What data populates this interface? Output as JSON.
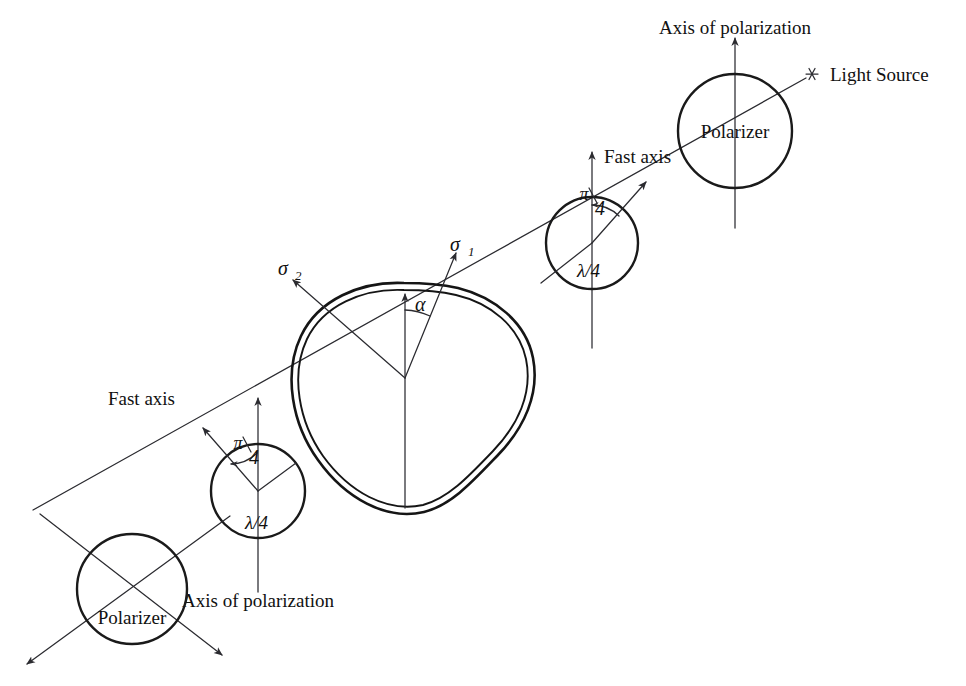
{
  "figure": {
    "background_color": "#ffffff",
    "line_color": "#1a1a1a",
    "width": 966,
    "height": 686
  },
  "labels": {
    "light_source": "Light Source",
    "axis_of_polarization_top": "Axis of polarization",
    "axis_of_polarization_bottom": "Axis of polarization",
    "polarizer_top": "Polarizer",
    "polarizer_bottom": "Polarizer",
    "fast_axis_top": "Fast axis",
    "fast_axis_bottom": "Fast axis",
    "quarter_wave_top": "λ/4",
    "quarter_wave_bottom": "λ/4",
    "angle_pi_over_4_top_numerator": "π",
    "angle_pi_over_4_top_denominator": "4",
    "angle_pi_over_4_bottom_numerator": "π",
    "angle_pi_over_4_bottom_denominator": "4",
    "specimen": "Specimen",
    "sigma_1_symbol": "σ",
    "sigma_1_subscript": "1",
    "sigma_2_symbol": "σ",
    "sigma_2_subscript": "2",
    "alpha_angle": "α"
  },
  "components": [
    {
      "name": "light-source",
      "kind": "source-marker",
      "label": "Light Source",
      "position": {
        "x": 812,
        "y": 74
      }
    },
    {
      "name": "polarizer-top",
      "kind": "polarizer",
      "label": "Polarizer",
      "center": {
        "x": 735,
        "y": 131
      },
      "radius": 57,
      "axis_label": "Axis of polarization",
      "axis_orientation": "vertical"
    },
    {
      "name": "quarter-wave-plate-top",
      "kind": "quarter-wave-plate",
      "label": "λ/4",
      "center": {
        "x": 592,
        "y": 243
      },
      "radius": 46,
      "fast_axis_label": "Fast axis",
      "fast_axis_direction": "up-right",
      "angle_label": "π/4",
      "angle_value_rad": 0.785398
    },
    {
      "name": "specimen",
      "kind": "specimen",
      "label": "Specimen",
      "center": {
        "x": 405,
        "y": 378
      },
      "principal_stress_1": "σ1",
      "principal_stress_2": "σ2",
      "angle_label": "α"
    },
    {
      "name": "quarter-wave-plate-bottom",
      "kind": "quarter-wave-plate",
      "label": "λ/4",
      "center": {
        "x": 258,
        "y": 491
      },
      "radius": 47,
      "fast_axis_label": "Fast axis",
      "fast_axis_direction": "up-left",
      "angle_label": "π/4",
      "angle_value_rad": 0.785398
    },
    {
      "name": "polarizer-bottom",
      "kind": "analyzer",
      "label": "Polarizer",
      "center": {
        "x": 132,
        "y": 589
      },
      "radius": 55,
      "axis_label": "Axis of polarization",
      "axis_orientation": "vertical"
    }
  ],
  "beam": {
    "name": "light-beam",
    "from": {
      "x": 812,
      "y": 74
    },
    "to": {
      "x": 33,
      "y": 510
    },
    "description": "optical axis of polariscope"
  }
}
